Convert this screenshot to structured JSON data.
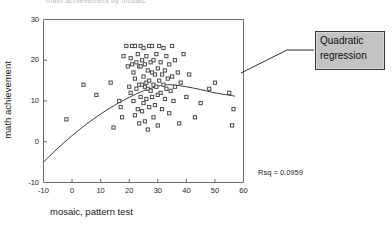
{
  "figure": {
    "title": "math achievement by mosaic",
    "background": "#ffffff",
    "frame_color": "#6b6b6b"
  },
  "callout": {
    "line1": "Quadratic",
    "line2": "regression",
    "fill": "#c3c3c3",
    "border": "#3a3a3a"
  },
  "stats": {
    "rsq_label": "Rsq = 0.0959"
  },
  "chart_data": {
    "type": "scatter",
    "title": "math achievement by mosaic",
    "xlabel": "mosaic, pattern test",
    "ylabel": "math achievement",
    "xlim": [
      -10,
      60
    ],
    "ylim": [
      -10,
      30
    ],
    "xticks": [
      -10,
      0,
      10,
      20,
      30,
      40,
      50,
      60
    ],
    "yticks": [
      -10,
      0,
      10,
      20,
      30
    ],
    "xtick_labels": [
      "-10",
      "0",
      "10",
      "20",
      "30",
      "40",
      "50",
      "60"
    ],
    "ytick_labels": [
      "-10",
      "0",
      "10",
      "20",
      "30"
    ],
    "grid": false,
    "legend": null,
    "marker": "open-square",
    "marker_color": "#4a4a4a",
    "annotations": [
      "Quadratic regression",
      "Rsq = 0.0959"
    ],
    "points": [
      [
        -2.0,
        5.5
      ],
      [
        4.0,
        14.0
      ],
      [
        8.5,
        11.5
      ],
      [
        13.5,
        14.5
      ],
      [
        14.5,
        3.5
      ],
      [
        16.5,
        10.0
      ],
      [
        17.0,
        8.5
      ],
      [
        17.5,
        6.0
      ],
      [
        18.0,
        21.0
      ],
      [
        19.0,
        23.5
      ],
      [
        19.5,
        18.5
      ],
      [
        20.0,
        13.5
      ],
      [
        20.5,
        20.5
      ],
      [
        20.5,
        12.0
      ],
      [
        21.0,
        23.5
      ],
      [
        21.0,
        19.0
      ],
      [
        21.5,
        17.0
      ],
      [
        21.5,
        10.0
      ],
      [
        22.0,
        23.5
      ],
      [
        22.0,
        15.5
      ],
      [
        22.0,
        6.5
      ],
      [
        22.5,
        19.5
      ],
      [
        22.5,
        13.0
      ],
      [
        23.0,
        21.5
      ],
      [
        23.0,
        8.0
      ],
      [
        23.5,
        18.5
      ],
      [
        23.5,
        14.0
      ],
      [
        23.5,
        4.5
      ],
      [
        24.0,
        23.5
      ],
      [
        24.0,
        18.5
      ],
      [
        24.0,
        11.0
      ],
      [
        24.5,
        20.0
      ],
      [
        24.5,
        14.0
      ],
      [
        24.5,
        7.5
      ],
      [
        25.0,
        23.0
      ],
      [
        25.0,
        16.0
      ],
      [
        25.0,
        9.5
      ],
      [
        25.5,
        19.0
      ],
      [
        25.5,
        13.5
      ],
      [
        25.5,
        5.0
      ],
      [
        26.0,
        21.0
      ],
      [
        26.0,
        14.5
      ],
      [
        26.0,
        10.5
      ],
      [
        26.5,
        17.5
      ],
      [
        26.5,
        13.0
      ],
      [
        26.5,
        3.0
      ],
      [
        27.0,
        23.5
      ],
      [
        27.0,
        15.0
      ],
      [
        27.0,
        8.5
      ],
      [
        27.5,
        19.5
      ],
      [
        27.5,
        12.5
      ],
      [
        28.0,
        23.5
      ],
      [
        28.0,
        17.0
      ],
      [
        28.0,
        11.0
      ],
      [
        28.5,
        20.0
      ],
      [
        28.5,
        14.0
      ],
      [
        28.5,
        6.0
      ],
      [
        29.0,
        16.5
      ],
      [
        29.0,
        9.0
      ],
      [
        29.5,
        21.5
      ],
      [
        29.5,
        13.5
      ],
      [
        30.0,
        18.0
      ],
      [
        30.0,
        11.5
      ],
      [
        30.0,
        4.0
      ],
      [
        30.5,
        23.5
      ],
      [
        30.5,
        15.0
      ],
      [
        31.0,
        19.5
      ],
      [
        31.0,
        12.0
      ],
      [
        31.5,
        16.5
      ],
      [
        31.5,
        8.0
      ],
      [
        32.0,
        23.0
      ],
      [
        32.0,
        14.0
      ],
      [
        32.5,
        17.5
      ],
      [
        32.5,
        10.5
      ],
      [
        33.0,
        21.0
      ],
      [
        33.0,
        13.0
      ],
      [
        33.5,
        15.5
      ],
      [
        34.0,
        19.0
      ],
      [
        34.0,
        7.0
      ],
      [
        34.5,
        12.5
      ],
      [
        35.0,
        23.5
      ],
      [
        35.0,
        16.0
      ],
      [
        35.5,
        10.0
      ],
      [
        36.0,
        20.0
      ],
      [
        36.0,
        13.5
      ],
      [
        37.0,
        17.0
      ],
      [
        37.5,
        4.5
      ],
      [
        38.0,
        14.5
      ],
      [
        39.0,
        21.5
      ],
      [
        40.0,
        11.0
      ],
      [
        41.0,
        16.5
      ],
      [
        43.0,
        6.0
      ],
      [
        45.0,
        9.5
      ],
      [
        48.0,
        13.0
      ],
      [
        50.0,
        14.5
      ],
      [
        55.0,
        12.0
      ],
      [
        56.0,
        4.0
      ],
      [
        56.5,
        8.0
      ]
    ],
    "fit": {
      "type": "quadratic",
      "rsq": 0.0959,
      "curve": [
        [
          -10,
          -5.0
        ],
        [
          -5,
          -1.6
        ],
        [
          0,
          1.5
        ],
        [
          5,
          4.3
        ],
        [
          10,
          6.8
        ],
        [
          15,
          9.0
        ],
        [
          20,
          10.9
        ],
        [
          25,
          12.5
        ],
        [
          30,
          13.6
        ],
        [
          33,
          14.0
        ],
        [
          36,
          13.9
        ],
        [
          40,
          13.5
        ],
        [
          45,
          12.8
        ],
        [
          50,
          12.0
        ],
        [
          57,
          11.2
        ]
      ]
    }
  }
}
